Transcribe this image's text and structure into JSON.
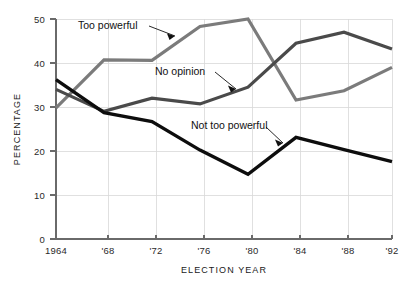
{
  "chart_data": {
    "type": "line",
    "title": "",
    "xlabel": "ELECTION YEAR",
    "ylabel": "PERCENTAGE",
    "x": [
      1964,
      1968,
      1972,
      1976,
      1980,
      1984,
      1988,
      1992
    ],
    "categories": [
      "1964",
      "'68",
      "'72",
      "'76",
      "'80",
      "'84",
      "'88",
      "'92"
    ],
    "xtick_labels": [
      "1964",
      "'68",
      "'72",
      "'76",
      "'80",
      "'84",
      "'88",
      "'92"
    ],
    "ytick_labels": [
      "0",
      "10",
      "20",
      "30",
      "40",
      "50"
    ],
    "ytick_values": [
      0,
      10,
      20,
      30,
      40,
      50
    ],
    "ylim": [
      0,
      50
    ],
    "grid": true,
    "legend": "inline-annotations",
    "series": [
      {
        "name": "Too powerful",
        "color": "#7b7b7b",
        "values": [
          29.8,
          40.7,
          40.6,
          48.3,
          50.0,
          31.6,
          33.7,
          39.0
        ]
      },
      {
        "name": "No opinion",
        "color": "#4a4a4a",
        "values": [
          34.0,
          29.0,
          32.0,
          30.7,
          34.5,
          44.5,
          47.0,
          43.2
        ]
      },
      {
        "name": "Not too powerful",
        "color": "#0d0d0d",
        "values": [
          36.2,
          28.7,
          26.7,
          20.2,
          14.7,
          23.1,
          20.3,
          17.6
        ]
      }
    ],
    "annotations": [
      {
        "text": "Too powerful",
        "label_x": 78,
        "label_y": 26
      },
      {
        "text": "No opinion",
        "label_x": 155,
        "label_y": 72
      },
      {
        "text": "Not too powerful",
        "label_x": 191,
        "label_y": 126
      }
    ]
  }
}
